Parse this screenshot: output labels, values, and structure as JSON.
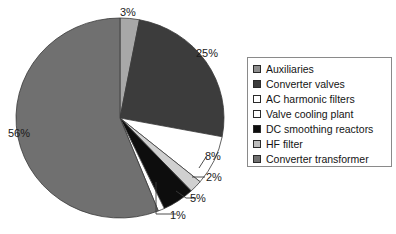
{
  "chart_data": {
    "type": "pie",
    "title": "",
    "xlabel": "",
    "ylabel": "",
    "legend_position": "right",
    "grid": false,
    "unit": "%",
    "categories": [
      "Auxiliaries",
      "Converter valves",
      "AC harmonic filters",
      "Valve cooling plant",
      "DC smoothing reactors",
      "HF filter",
      "Converter transformer"
    ],
    "values": [
      1,
      25,
      8,
      2,
      5,
      3,
      56
    ],
    "colors": [
      "#ffffff",
      "#3c3c3c",
      "#ffffff",
      "#d0d0d0",
      "#0d0d0d",
      "#a8a8a8",
      "#707070"
    ],
    "slices": [
      {
        "label": "HF filter",
        "value": 3,
        "display": "3%",
        "color": "#a8a8a8"
      },
      {
        "label": "Converter valves",
        "value": 25,
        "display": "25%",
        "color": "#3c3c3c"
      },
      {
        "label": "AC harmonic filters",
        "value": 8,
        "display": "8%",
        "color": "#ffffff"
      },
      {
        "label": "Valve cooling plant",
        "value": 2,
        "display": "2%",
        "color": "#d0d0d0"
      },
      {
        "label": "DC smoothing reactors",
        "value": 5,
        "display": "5%",
        "color": "#0d0d0d"
      },
      {
        "label": "Auxiliaries",
        "value": 1,
        "display": "1%",
        "color": "#ffffff"
      },
      {
        "label": "Converter transformer",
        "value": 56,
        "display": "56%",
        "color": "#707070"
      }
    ]
  },
  "labels": {
    "pct_3": "3%",
    "pct_25": "25%",
    "pct_56": "56%",
    "pct_8": "8%",
    "pct_2": "2%",
    "pct_5": "5%",
    "pct_1": "1%"
  },
  "legend": {
    "items": [
      {
        "label": "Auxiliaries",
        "color": "#8e8e8e"
      },
      {
        "label": "Converter valves",
        "color": "#3c3c3c"
      },
      {
        "label": "AC harmonic filters",
        "color": "#ffffff"
      },
      {
        "label": "Valve cooling plant",
        "color": "#ffffff"
      },
      {
        "label": "DC smoothing reactors",
        "color": "#0d0d0d"
      },
      {
        "label": "HF filter",
        "color": "#bdbdbd"
      },
      {
        "label": "Converter transformer",
        "color": "#707070"
      }
    ]
  }
}
